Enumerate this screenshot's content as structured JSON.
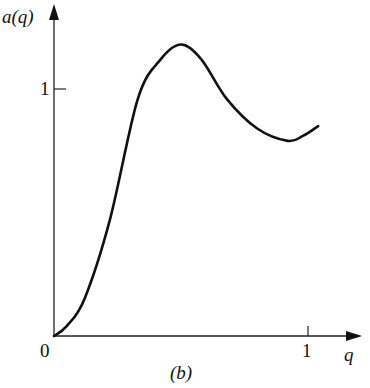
{
  "chart_data": {
    "type": "line",
    "title": "",
    "caption": "(b)",
    "xlabel": "q",
    "ylabel": "a(q)",
    "xlim": [
      0,
      1.15
    ],
    "ylim": [
      0,
      1.3
    ],
    "x_ticks": [
      {
        "value": 0,
        "label": "0"
      },
      {
        "value": 1,
        "label": "1"
      }
    ],
    "y_ticks": [
      {
        "value": 1,
        "label": "1"
      }
    ],
    "grid": false,
    "legend": null,
    "series": [
      {
        "name": "a(q)",
        "x": [
          0,
          0.05,
          0.12,
          0.22,
          0.33,
          0.42,
          0.5,
          0.58,
          0.68,
          0.8,
          0.92,
          0.98,
          1.04
        ],
        "y": [
          0,
          0.04,
          0.15,
          0.47,
          0.96,
          1.12,
          1.18,
          1.12,
          0.96,
          0.84,
          0.79,
          0.81,
          0.85
        ]
      }
    ]
  },
  "labels": {
    "y_axis": "a(q)",
    "x_axis": "q",
    "origin": "0",
    "x_tick_1": "1",
    "y_tick_1": "1",
    "caption": "(b)"
  }
}
